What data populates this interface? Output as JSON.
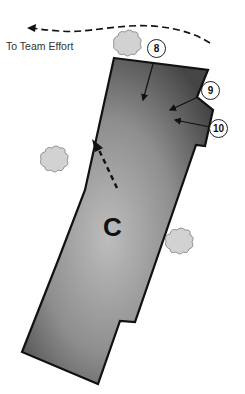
{
  "diagram": {
    "direction_label": "To Team Effort",
    "zone_label": "C",
    "callouts": [
      {
        "id": "8",
        "label": "8"
      },
      {
        "id": "9",
        "label": "9"
      },
      {
        "id": "10",
        "label": "10"
      }
    ],
    "colors": {
      "zone_fill_dark": "#4a4a4a",
      "zone_fill_light": "#b8b8b8",
      "outline": "#111111",
      "bush_fill": "#d0d0d0",
      "bush_stroke": "#888888"
    }
  }
}
